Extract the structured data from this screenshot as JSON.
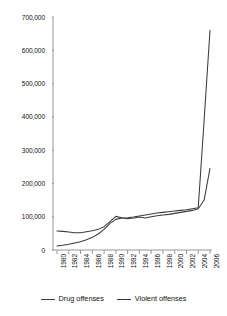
{
  "chart_data": {
    "type": "line",
    "title": "",
    "subtitle": "",
    "xlabel": "",
    "ylabel": "",
    "xlim": [
      1980,
      2006
    ],
    "ylim": [
      0,
      700000
    ],
    "grid": false,
    "legend_position": "bottom",
    "x_tick_labels": [
      "1980",
      "1982",
      "1984",
      "1986",
      "1988",
      "1990",
      "1992",
      "1994",
      "1996",
      "1998",
      "2000",
      "2002",
      "2004",
      "2006"
    ],
    "y_tick_labels": [
      "0",
      "100,000",
      "200,000",
      "300,000",
      "400,000",
      "500,000",
      "600,000",
      "700,000"
    ],
    "y_tick_values": [
      0,
      100000,
      200000,
      300000,
      400000,
      500000,
      600000,
      700000
    ],
    "x": [
      1980,
      1981,
      1982,
      1983,
      1984,
      1985,
      1986,
      1987,
      1988,
      1989,
      1990,
      1991,
      1992,
      1993,
      1994,
      1995,
      1996,
      1997,
      1998,
      1999,
      2000,
      2001,
      2002,
      2003,
      2004,
      2005,
      2006
    ],
    "series": [
      {
        "name": "Drug offenses",
        "color": "#3b3b3b",
        "values": [
          12000,
          14000,
          17000,
          21000,
          25000,
          31000,
          38000,
          48000,
          62000,
          80000,
          92000,
          96000,
          97000,
          99000,
          102000,
          105000,
          108000,
          111000,
          113000,
          115000,
          117000,
          119000,
          121000,
          124000,
          127000,
          390000,
          660000
        ]
      },
      {
        "name": "Violent offenses",
        "color": "#3b3b3b",
        "values": [
          57000,
          56000,
          54000,
          52000,
          52000,
          55000,
          58000,
          62000,
          70000,
          85000,
          101000,
          97000,
          94000,
          96000,
          99000,
          96000,
          100000,
          103000,
          105000,
          107000,
          110000,
          113000,
          116000,
          119000,
          124000,
          150000,
          245000
        ]
      }
    ]
  },
  "legend": {
    "items": [
      {
        "label": "Drug offenses"
      },
      {
        "label": "Violent offenses"
      }
    ]
  }
}
